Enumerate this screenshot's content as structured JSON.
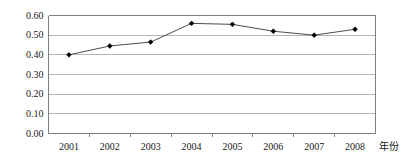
{
  "chart_data": {
    "type": "line",
    "title": "",
    "subtitle": "",
    "xlabel": "年份",
    "ylabel": "",
    "categories": [
      "2001",
      "2002",
      "2003",
      "2004",
      "2005",
      "2006",
      "2007",
      "2008"
    ],
    "values": [
      0.4,
      0.445,
      0.465,
      0.56,
      0.555,
      0.52,
      0.5,
      0.53
    ],
    "series": [
      {
        "name": "",
        "values": [
          0.4,
          0.445,
          0.465,
          0.56,
          0.555,
          0.52,
          0.5,
          0.53
        ]
      }
    ],
    "ylim": [
      0.0,
      0.6
    ],
    "ytick_labels": [
      "0.60",
      "0.50",
      "0.40",
      "0.30",
      "0.20",
      "0.10",
      "0.00"
    ],
    "ytick_values": [
      0.6,
      0.5,
      0.4,
      0.3,
      0.2,
      0.1,
      0.0
    ],
    "xtick_labels": [
      "2001",
      "2002",
      "2003",
      "2004",
      "2005",
      "2006",
      "2007",
      "2008"
    ],
    "grid": true,
    "grid_axis": "y",
    "legend": false,
    "legend_position": "none",
    "marker": "diamond",
    "annotations": []
  },
  "colors": {
    "line": "#4d4d4d",
    "marker": "#000000",
    "grid": "#b3b3b3",
    "axis": "#808080",
    "text": "#1a1a1a",
    "background": "#ffffff"
  },
  "axis_label_text": "年份"
}
